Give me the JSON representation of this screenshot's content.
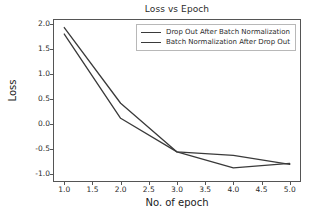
{
  "chart_data": {
    "type": "line",
    "title": "Loss vs Epoch",
    "xlabel": "No. of epoch",
    "ylabel": "Loss",
    "x": [
      1.0,
      2.0,
      3.0,
      4.0,
      5.0
    ],
    "xlim": [
      0.8,
      5.2
    ],
    "ylim": [
      -1.15,
      2.1
    ],
    "grid": false,
    "legend_position": "top-center",
    "xticks": [
      "1.0",
      "1.5",
      "2.0",
      "2.5",
      "3.0",
      "3.5",
      "4.0",
      "4.5",
      "5.0"
    ],
    "xtick_values": [
      1.0,
      1.5,
      2.0,
      2.5,
      3.0,
      3.5,
      4.0,
      4.5,
      5.0
    ],
    "yticks": [
      "2.0",
      "1.5",
      "1.0",
      "0.5",
      "0.0",
      "-0.5",
      "-1.0"
    ],
    "ytick_values": [
      2.0,
      1.5,
      1.0,
      0.5,
      0.0,
      -0.5,
      -1.0
    ],
    "series": [
      {
        "name": "Drop Out After Batch Normalization",
        "color": "#3a3a3a",
        "values": [
          1.93,
          0.42,
          -0.55,
          -0.62,
          -0.8
        ]
      },
      {
        "name": "Batch Normalization After Drop Out",
        "color": "#3a3a3a",
        "values": [
          1.8,
          0.12,
          -0.55,
          -0.87,
          -0.78
        ]
      }
    ]
  },
  "figure": {
    "background_color": "#ffffff",
    "axes_color": "#555555"
  }
}
